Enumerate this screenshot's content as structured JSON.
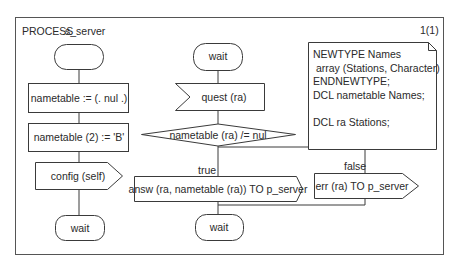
{
  "frame": {
    "header": "PROCESS",
    "process_name": "s_server",
    "page_number": "1(1)"
  },
  "left_column": {
    "start_label": "",
    "task1": "nametable := (. nul .)",
    "task2": "nametable (2) := 'B'",
    "output": "config (self)",
    "end_state": "wait"
  },
  "main_column": {
    "state": "wait",
    "input": "quest (ra)",
    "decision": "nametable (ra) /= nul",
    "true_label": "true",
    "false_label": "false",
    "true_output": "answ (ra, nametable (ra)) TO p_server",
    "false_output": "err (ra) TO p_server",
    "end_state": "wait"
  },
  "note": {
    "lines": [
      "NEWTYPE Names",
      " array (Stations, Character)",
      "ENDNEWTYPE;",
      "DCL nametable Names;",
      "",
      "DCL ra Stations;"
    ],
    "text": "NEWTYPE Names\n array (Stations, Character)\nENDNEWTYPE;\nDCL nametable Names;\n\nDCL ra Stations;"
  },
  "colors": {
    "stroke": "#3a3a3a",
    "text": "#2a2a2a",
    "background": "#ffffff"
  }
}
